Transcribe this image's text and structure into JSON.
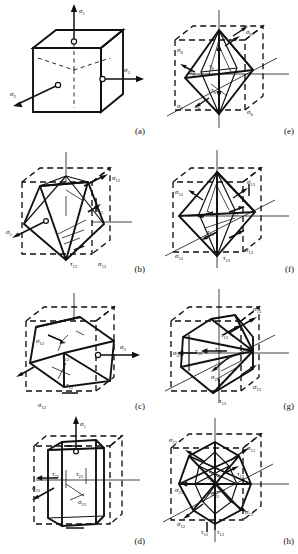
{
  "figure": {
    "grid": {
      "columns": 2,
      "rows": 4
    },
    "ink_color": "#111111",
    "background_color": "#ffffff"
  },
  "symbols": {
    "sigma": "σ",
    "tau": "τ",
    "open_circle": "○"
  },
  "panels": [
    {
      "id": "a",
      "label": "(a)",
      "shape": "cube",
      "description": "Cube with three mutually perpendicular principal stress axes",
      "stresses": [
        {
          "symbol": "σ",
          "subscript": "1",
          "type": "normal",
          "position": "top"
        },
        {
          "symbol": "σ",
          "subscript": "2",
          "type": "normal",
          "position": "left"
        },
        {
          "symbol": "σ",
          "subscript": "3",
          "type": "normal",
          "position": "right"
        }
      ]
    },
    {
      "id": "e",
      "label": "(e)",
      "shape": "octahedron",
      "description": "Octahedron inscribed in dashed cube with octahedral stresses",
      "stresses": [
        {
          "symbol": "σ",
          "subscript": "8",
          "type": "normal",
          "position": "upper-left"
        },
        {
          "symbol": "σ",
          "subscript": "8",
          "type": "normal",
          "position": "upper-right"
        },
        {
          "symbol": "σ",
          "subscript": "8",
          "type": "normal",
          "position": "lower-left"
        },
        {
          "symbol": "σ",
          "subscript": "8",
          "type": "normal",
          "position": "lower-right"
        },
        {
          "symbol": "τ",
          "subscript": "8",
          "type": "shear",
          "position": "center-upper"
        },
        {
          "symbol": "τ",
          "subscript": "8",
          "type": "shear",
          "position": "center-lower"
        },
        {
          "symbol": "τ",
          "subscript": "8",
          "type": "shear",
          "position": "bottom-left"
        }
      ]
    },
    {
      "id": "b",
      "label": "(b)",
      "shape": "rhombic-dodecahedron-section",
      "description": "Rotated rhombic cell inscribed in dashed cube",
      "stresses": [
        {
          "symbol": "σ",
          "subscript": "13",
          "type": "normal",
          "position": "upper-right"
        },
        {
          "symbol": "τ",
          "subscript": "13",
          "type": "shear",
          "position": "center-right"
        },
        {
          "symbol": "σ",
          "subscript": "2",
          "type": "normal",
          "position": "left"
        },
        {
          "symbol": "τ",
          "subscript": "13",
          "type": "shear",
          "position": "bottom-center"
        },
        {
          "symbol": "σ",
          "subscript": "13",
          "type": "normal",
          "position": "bottom-right"
        }
      ]
    },
    {
      "id": "f",
      "label": "(f)",
      "shape": "octahedron",
      "description": "Octahedron in dashed cube with 12-type and 13-type stresses",
      "stresses": [
        {
          "symbol": "σ",
          "subscript": "12",
          "type": "normal",
          "position": "upper-left"
        },
        {
          "symbol": "σ",
          "subscript": "13",
          "type": "normal",
          "position": "upper-right"
        },
        {
          "symbol": "τ",
          "subscript": "12",
          "type": "shear",
          "position": "center-left"
        },
        {
          "symbol": "τ",
          "subscript": "13",
          "type": "shear",
          "position": "center-right"
        },
        {
          "symbol": "τ",
          "subscript": "12",
          "type": "shear",
          "position": "center-lower"
        },
        {
          "symbol": "σ",
          "subscript": "12",
          "type": "normal",
          "position": "bottom-left"
        },
        {
          "symbol": "τ",
          "subscript": "13",
          "type": "shear",
          "position": "bottom-center"
        },
        {
          "symbol": "σ",
          "subscript": "13",
          "type": "normal",
          "position": "bottom-right"
        }
      ]
    },
    {
      "id": "c",
      "label": "(c)",
      "shape": "hexagonal-prism-oblique",
      "description": "Hexagonal cross-section body in dashed cube",
      "stresses": [
        {
          "symbol": "σ",
          "subscript": "12",
          "type": "normal",
          "position": "upper-left"
        },
        {
          "symbol": "τ",
          "subscript": "12",
          "type": "shear",
          "position": "center-upper"
        },
        {
          "symbol": "τ",
          "subscript": "12",
          "type": "shear",
          "position": "center-lower"
        },
        {
          "symbol": "σ",
          "subscript": "12",
          "type": "normal",
          "position": "bottom-left"
        },
        {
          "symbol": "σ",
          "subscript": "3",
          "type": "normal",
          "position": "right"
        }
      ]
    },
    {
      "id": "g",
      "label": "(g)",
      "shape": "irregular-polyhedron",
      "description": "Polyhedron in dashed cube with 13-type and 23-type stresses",
      "stresses": [
        {
          "symbol": "σ",
          "subscript": "13",
          "type": "normal",
          "position": "top-right"
        },
        {
          "symbol": "τ",
          "subscript": "13",
          "type": "shear",
          "position": "upper-center"
        },
        {
          "symbol": "σ",
          "subscript": "23",
          "type": "normal",
          "position": "left"
        },
        {
          "symbol": "τ",
          "subscript": "23",
          "type": "shear",
          "position": "center-left"
        },
        {
          "symbol": "τ",
          "subscript": "23",
          "type": "shear",
          "position": "center"
        },
        {
          "symbol": "σ",
          "subscript": "23",
          "type": "normal",
          "position": "center-lower"
        },
        {
          "symbol": "σ",
          "subscript": "13",
          "type": "normal",
          "position": "lower-right"
        },
        {
          "symbol": "τ",
          "subscript": "13",
          "type": "shear",
          "position": "bottom-center"
        }
      ]
    },
    {
      "id": "d",
      "label": "(d)",
      "shape": "hexagonal-prism",
      "description": "Vertical hexagonal prism in dashed cube",
      "stresses": [
        {
          "symbol": "σ",
          "subscript": "1",
          "type": "normal",
          "position": "top"
        },
        {
          "symbol": "τ",
          "subscript": "23",
          "type": "shear",
          "position": "left-inner"
        },
        {
          "symbol": "τ",
          "subscript": "23",
          "type": "shear",
          "position": "center"
        },
        {
          "symbol": "σ",
          "subscript": "23",
          "type": "normal",
          "position": "left"
        },
        {
          "symbol": "σ",
          "subscript": "23",
          "type": "normal",
          "position": "center-lower"
        }
      ]
    },
    {
      "id": "h",
      "label": "(h)",
      "shape": "complex-polyhedron",
      "description": "Complex polyhedron combining 12-type and 13-type stress planes",
      "stresses": [
        {
          "symbol": "σ",
          "subscript": "12",
          "type": "normal",
          "position": "top-left"
        },
        {
          "symbol": "σ",
          "subscript": "13",
          "type": "normal",
          "position": "top-right"
        },
        {
          "symbol": "τ",
          "subscript": "12",
          "type": "shear",
          "position": "center-upper"
        },
        {
          "symbol": "τ",
          "subscript": "13",
          "type": "shear",
          "position": "center-right"
        },
        {
          "symbol": "σ",
          "subscript": "23",
          "type": "normal",
          "position": "left"
        },
        {
          "symbol": "σ",
          "subscript": "23",
          "type": "normal",
          "position": "center"
        },
        {
          "symbol": "σ",
          "subscript": "13",
          "type": "normal",
          "position": "lower-right"
        },
        {
          "symbol": "σ",
          "subscript": "12",
          "type": "normal",
          "position": "bottom-left"
        },
        {
          "symbol": "τ",
          "subscript": "12",
          "type": "shear",
          "position": "bottom-center-left"
        },
        {
          "symbol": "τ",
          "subscript": "13",
          "type": "shear",
          "position": "bottom-center-right"
        }
      ]
    }
  ]
}
